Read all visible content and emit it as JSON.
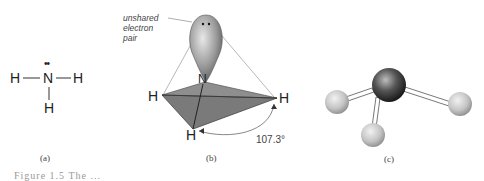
{
  "panel_a": {
    "label": "(a)",
    "atoms": {
      "left_h": "H",
      "center_n": "N",
      "right_h": "H",
      "bottom_h": "H"
    },
    "lone_pair": "••"
  },
  "panel_b": {
    "label": "(b)",
    "annotation": [
      "unshared",
      "electron",
      "pair"
    ],
    "atoms": {
      "n": "N",
      "left_h": "H",
      "right_h": "H",
      "bottom_h": "H"
    },
    "angle": "107.3°"
  },
  "panel_c": {
    "label": "(c)"
  },
  "caption": "Figure 1.5  The ..."
}
